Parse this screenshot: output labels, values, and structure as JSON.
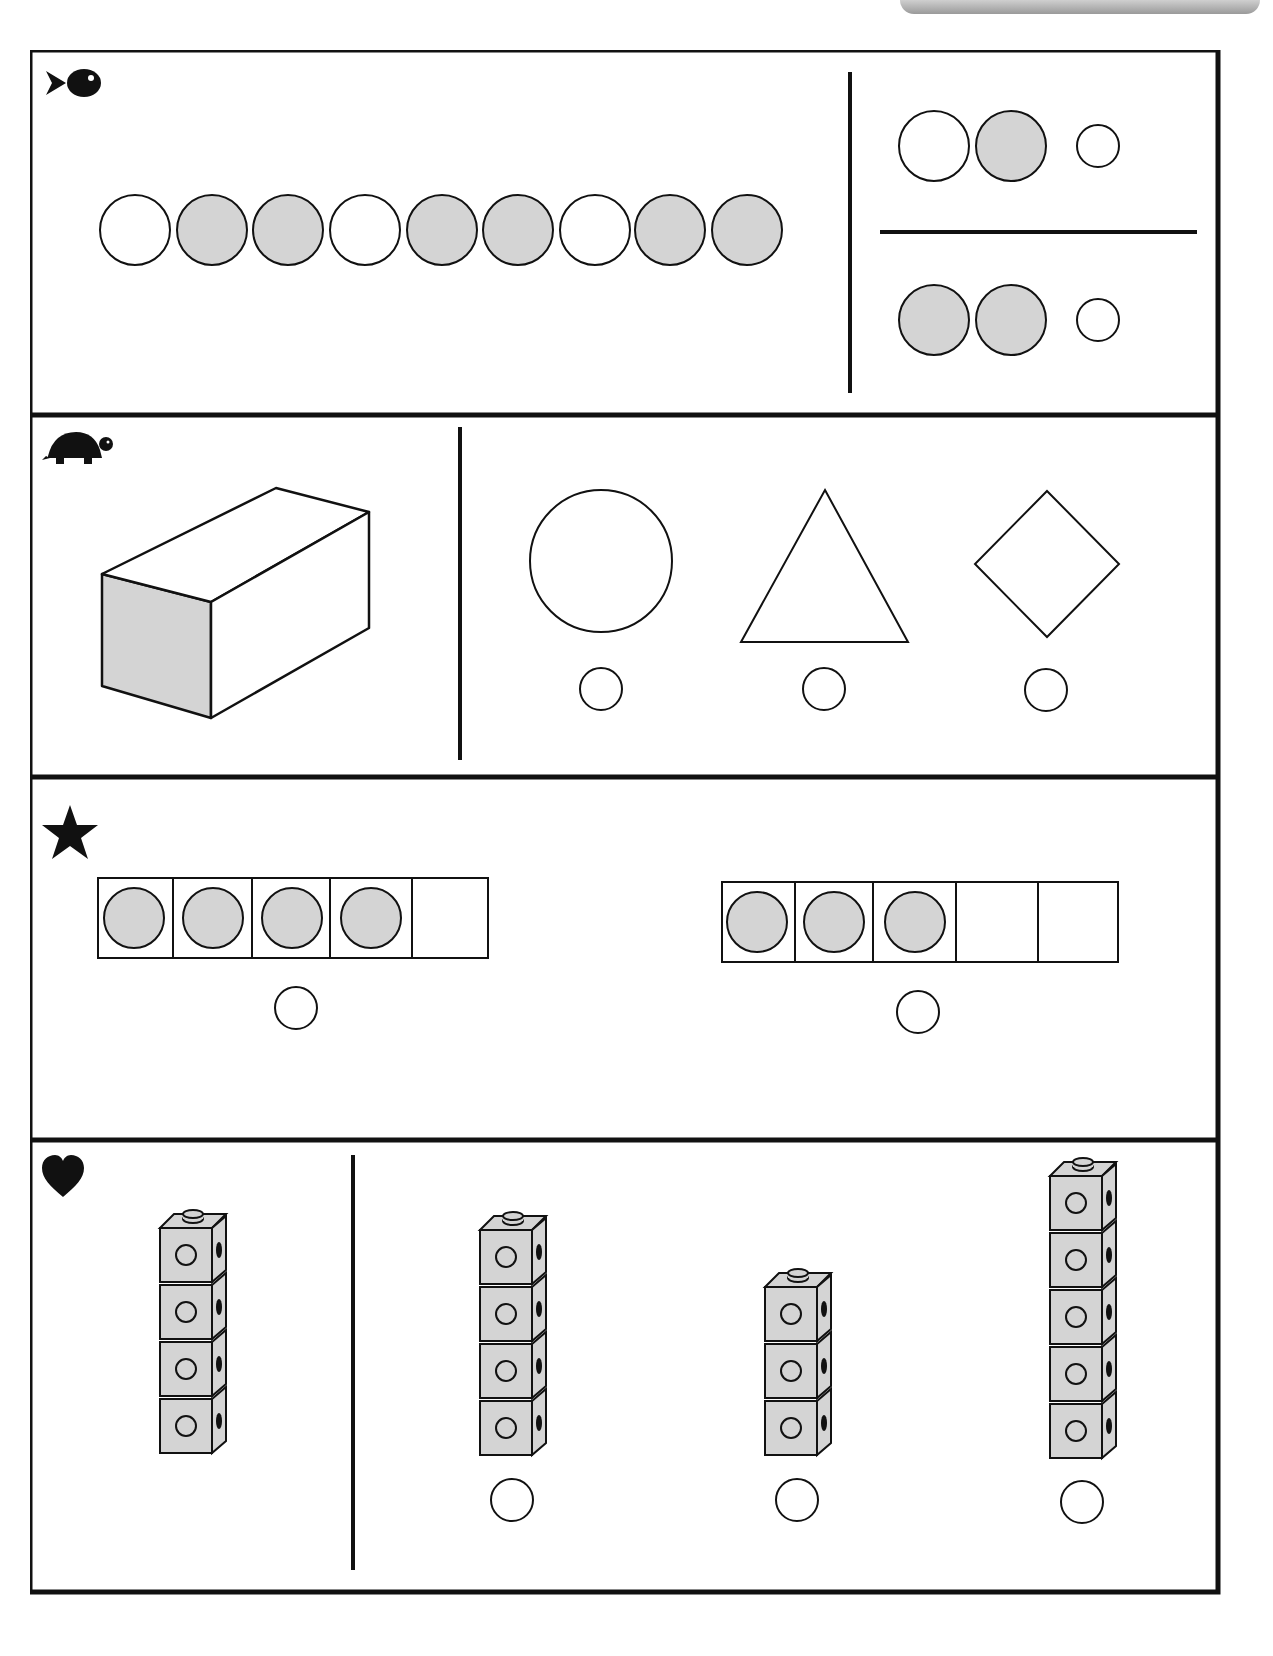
{
  "worksheet": {
    "rows": [
      {
        "id": "fish",
        "icon": "fish-icon",
        "pattern_strip": [
          "white",
          "gray",
          "gray",
          "white",
          "gray",
          "gray",
          "white",
          "gray",
          "gray"
        ],
        "choices": [
          {
            "circles": [
              "white",
              "gray"
            ],
            "answer_bubble": "empty"
          },
          {
            "circles": [
              "gray",
              "gray"
            ],
            "answer_bubble": "empty"
          }
        ]
      },
      {
        "id": "turtle",
        "icon": "turtle-icon",
        "solid": "rectangular-prism",
        "shaded_face": "square",
        "choices": [
          {
            "shape": "circle",
            "answer_bubble": "empty"
          },
          {
            "shape": "triangle",
            "answer_bubble": "empty"
          },
          {
            "shape": "square-diamond",
            "answer_bubble": "empty"
          }
        ]
      },
      {
        "id": "star",
        "icon": "star-icon",
        "five_frames": [
          {
            "counters": 4,
            "cells": 5,
            "answer_bubble": "empty"
          },
          {
            "counters": 3,
            "cells": 5,
            "answer_bubble": "empty"
          }
        ]
      },
      {
        "id": "heart",
        "icon": "heart-icon",
        "model_tower_cubes": 4,
        "choices": [
          {
            "cubes": 4,
            "answer_bubble": "empty"
          },
          {
            "cubes": 3,
            "answer_bubble": "empty"
          },
          {
            "cubes": 5,
            "answer_bubble": "empty"
          }
        ]
      }
    ],
    "colors": {
      "ink": "#111111",
      "shade": "#d4d4d4",
      "paper": "#ffffff"
    }
  }
}
